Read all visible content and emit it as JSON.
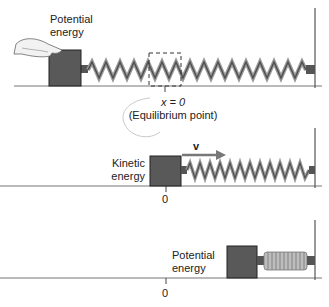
{
  "panels": [
    {
      "id": "compressed-start",
      "label_line1": "Potential",
      "label_line2": "energy",
      "equilibrium_label": "x = 0",
      "equilibrium_sublabel": "(Equilibrium point)"
    },
    {
      "id": "moving-at-equilibrium",
      "label_line1": "Kinetic",
      "label_line2": "energy",
      "velocity_label": "v",
      "tick_label": "0"
    },
    {
      "id": "compressed-end",
      "label_line1": "Potential",
      "label_line2": "energy",
      "tick_label": "0"
    }
  ],
  "colors": {
    "block": "#555555",
    "spring_dark": "#4a4a4a",
    "spring_light": "#a8a8a8",
    "ground": "#666666",
    "wall": "#444444"
  }
}
